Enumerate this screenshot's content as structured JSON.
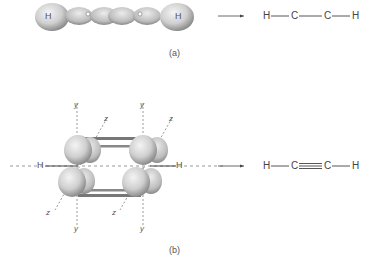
{
  "panel_a": {
    "label": "(a)",
    "orbital_atom_left": "H",
    "orbital_atom_right": "H",
    "formula": {
      "atoms": [
        "H",
        "C",
        "C",
        "H"
      ],
      "bonds": [
        "single",
        "single",
        "single"
      ]
    }
  },
  "panel_b": {
    "label": "(b)",
    "atom_left": "H",
    "atom_right": "H",
    "axis_labels": {
      "y_top_left": "y",
      "y_top_right": "y",
      "y_bottom_left": "y",
      "y_bottom_right": "y",
      "z_top_left": "z",
      "z_top_right": "z",
      "z_bottom_left": "z",
      "z_bottom_right": "z"
    },
    "formula": {
      "atoms": [
        "H",
        "C",
        "C",
        "H"
      ],
      "bonds": [
        "single",
        "triple",
        "single"
      ]
    }
  },
  "colors": {
    "ink": "#444444",
    "orbital_fill": "#d8d8d8",
    "orbital_shade": "#9a9a9a",
    "background": "#ffffff"
  }
}
